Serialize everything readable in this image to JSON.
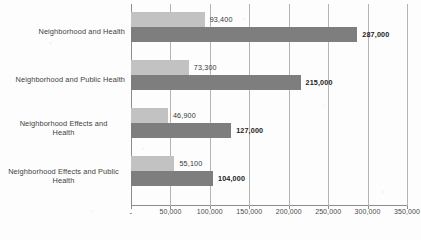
{
  "chart_data": {
    "type": "bar",
    "orientation": "horizontal",
    "title": "",
    "xlabel": "",
    "ylabel": "",
    "xlim": [
      0,
      350000
    ],
    "xticks": [
      0,
      50000,
      100000,
      150000,
      200000,
      250000,
      300000,
      350000
    ],
    "xtick_labels": [
      "-",
      "50,000",
      "100,000",
      "150,000",
      "200,000",
      "250,000",
      "300,000",
      "350,000"
    ],
    "grid": true,
    "legend": "none",
    "categories": [
      "Neighborhood and Health",
      "Neighborhood and Public Health",
      "Neighborhood Effects and Health",
      "Neighborhood Effects and Public Health"
    ],
    "series": [
      {
        "name": "light-series",
        "color": "#c2c2c2",
        "values": [
          93400,
          73300,
          46900,
          55100
        ],
        "labels": [
          "93,400",
          "73,300",
          "46,900",
          "55,100"
        ]
      },
      {
        "name": "dark-series",
        "color": "#7e7e7e",
        "values": [
          287000,
          215000,
          127000,
          104000
        ],
        "labels": [
          "287,000",
          "215,000",
          "127,000",
          "104,000"
        ]
      }
    ]
  },
  "axis": {
    "line_color": "#8c8c8c",
    "grid_color": "#b4b4b4"
  },
  "categories_display": [
    {
      "line1": "Neighborhood and Health",
      "line2": ""
    },
    {
      "line1": "Neighborhood and Public Health",
      "line2": ""
    },
    {
      "line1": "Neighborhood Effects and",
      "line2": "Health"
    },
    {
      "line1": "Neighborhood Effects and Public",
      "line2": "Health"
    }
  ]
}
